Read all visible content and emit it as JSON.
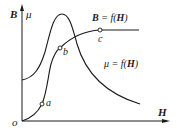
{
  "axes": {
    "y_label_left": "B",
    "y_label_right": "μ",
    "x_label": "H",
    "origin_label": "o"
  },
  "curves": {
    "B_curve": {
      "label": "B = f(H)",
      "label_parts": {
        "var": "B",
        "eq": " = f(",
        "arg": "H",
        "close": ")"
      }
    },
    "mu_curve": {
      "label": "μ = f(H)",
      "label_parts": {
        "var": "μ",
        "eq": " = f(",
        "arg": "H",
        "close": ")"
      }
    }
  },
  "points": [
    {
      "name": "a",
      "label": "a"
    },
    {
      "name": "b",
      "label": "b"
    },
    {
      "name": "c",
      "label": "c"
    }
  ],
  "colors": {
    "line": "#1a1a1a",
    "background": "#ffffff"
  }
}
